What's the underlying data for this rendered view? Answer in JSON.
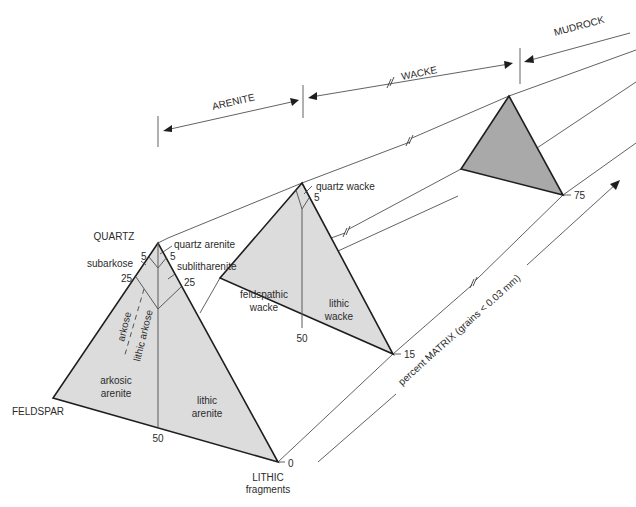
{
  "diagram": {
    "type": "sandstone-classification-ternary-prisms",
    "colors": {
      "light_fill": "#dcdcdc",
      "dark_fill": "#a9a9a9",
      "line": "#1e1e1e",
      "text": "#2b2b2b"
    },
    "ranges": {
      "arenite": "ARENITE",
      "wacke": "WACKE",
      "mudrock": "MUDROCK"
    },
    "vertices": {
      "quartz": "QUARTZ",
      "feldspar": "FELDSPAR",
      "lithic_line1": "LITHIC",
      "lithic_line2": "fragments"
    },
    "arenite_triangle": {
      "fields": {
        "quartz_arenite": "quartz arenite",
        "subarkose": "subarkose",
        "sublitharenite": "sublitharenite",
        "arkose": "arkose",
        "lithic_arkose": "lithic arkose",
        "arkosic_arenite_1": "arkosic",
        "arkosic_arenite_2": "arenite",
        "lithic_arenite_1": "lithic",
        "lithic_arenite_2": "arenite"
      },
      "ticks": {
        "left_5": "5",
        "right_5": "5",
        "left_25": "25",
        "right_25": "25",
        "base_50": "50",
        "matrix_value": "0"
      }
    },
    "wacke_triangle": {
      "fields": {
        "quartz_wacke": "quartz wacke",
        "feldspathic_wacke_1": "feldspathic",
        "feldspathic_wacke_2": "wacke",
        "lithic_wacke_1": "lithic",
        "lithic_wacke_2": "wacke"
      },
      "ticks": {
        "right_5": "5",
        "base_50": "50",
        "matrix_value": "15"
      }
    },
    "mudrock_triangle": {
      "ticks": {
        "matrix_value": "75"
      }
    },
    "matrix_axis": {
      "label": "percent MATRIX (grains < 0.03 mm)"
    }
  }
}
